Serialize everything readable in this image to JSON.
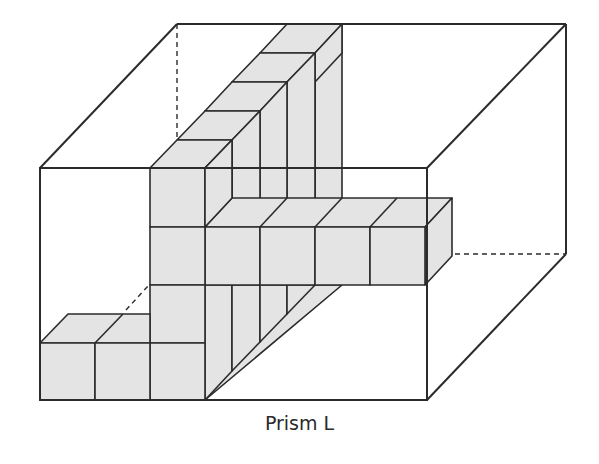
{
  "caption": "Prism L",
  "colors": {
    "stroke": "#2b2b2b",
    "cube_fill": "#e4e4e4",
    "background": "#ffffff"
  },
  "prism": {
    "front_face": {
      "x1": 40,
      "y1": 168,
      "x2": 427,
      "y2": 400
    },
    "depth_offset": {
      "dx": 139,
      "dy": -144
    },
    "hidden_edges": "dashed"
  },
  "cube_unit": {
    "w": 55,
    "h": 58,
    "ddx": 27.5,
    "ddy": -28.8
  }
}
